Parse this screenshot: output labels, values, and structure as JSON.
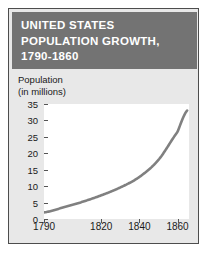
{
  "figure": {
    "title_lines": [
      "UNITED STATES",
      "POPULATION GROWTH,",
      "1790-1860"
    ],
    "axis_title_lines": [
      "Population",
      "(in millions)"
    ],
    "colors": {
      "title_bar": "#737373",
      "panel": "#e8e8e8",
      "plot": "#ffffff",
      "line": "#808080",
      "border": "#4d4d4d",
      "text": "#1a1a1a"
    }
  },
  "chart_data": {
    "type": "line",
    "title": "UNITED STATES POPULATION GROWTH, 1790-1860",
    "xlabel": "",
    "ylabel": "Population (in millions)",
    "xlim": [
      1790,
      1866
    ],
    "ylim": [
      0,
      35
    ],
    "grid": false,
    "legend": null,
    "y_ticks": [
      35,
      30,
      25,
      20,
      15,
      10,
      5,
      0
    ],
    "x_ticks": [
      1790,
      1820,
      1840,
      1860
    ],
    "x_tick_labels": [
      "1790",
      "1820",
      "1840",
      "1860"
    ],
    "series": [
      {
        "name": "U.S. population",
        "x": [
          1790,
          1800,
          1810,
          1820,
          1830,
          1840,
          1850,
          1860,
          1865
        ],
        "values": [
          2.0,
          3.5,
          5.2,
          7.2,
          9.6,
          12.8,
          18.0,
          26.5,
          33.0
        ]
      }
    ]
  }
}
